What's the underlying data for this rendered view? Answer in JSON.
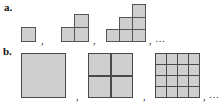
{
  "figure": {
    "type": "math-shape-sequence-diagram",
    "background_color": "#ffffff",
    "cell_fill_color": "#cfcfcf",
    "cell_border_color": "#555555",
    "text_color": "#111111",
    "separator": ",",
    "ellipsis": "…",
    "rows": [
      {
        "label": "a.",
        "description": "staircase figures built from unit squares, terms 1, 3, 6",
        "terms": [
          {
            "index": 1,
            "cell_count": 1,
            "column_heights": [
              1
            ]
          },
          {
            "index": 2,
            "cell_count": 3,
            "column_heights": [
              1,
              2
            ]
          },
          {
            "index": 3,
            "cell_count": 6,
            "column_heights": [
              1,
              2,
              3
            ]
          }
        ]
      },
      {
        "label": "b.",
        "description": "squares subdivided into n by n congruent cells, terms 1, 4, 16",
        "terms": [
          {
            "index": 1,
            "divisions": 1,
            "cell_count": 1
          },
          {
            "index": 2,
            "divisions": 2,
            "cell_count": 4
          },
          {
            "index": 3,
            "divisions": 4,
            "cell_count": 16
          }
        ]
      }
    ]
  }
}
